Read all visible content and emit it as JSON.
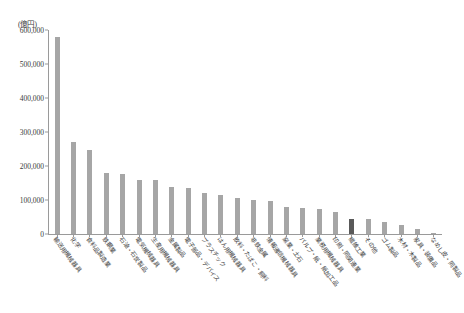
{
  "chart_data": {
    "type": "bar",
    "title": "",
    "subtitle": "",
    "xlabel": "",
    "ylabel": "",
    "unit_label": "(億円)",
    "ylim": [
      0,
      600000
    ],
    "ytick_labels": [
      "600,000",
      "500,000",
      "400,000",
      "300,000",
      "200,000",
      "100,000",
      "0"
    ],
    "ytick_values": [
      600000,
      500000,
      400000,
      300000,
      200000,
      100000,
      0
    ],
    "grid": false,
    "legend": "none",
    "highlight_index": 18,
    "colors": {
      "bar": "#a6a6a6",
      "bar_highlight": "#595959",
      "axis": "#9a9a9a",
      "text": "#3a3a3a"
    },
    "categories": [
      "輸送用機械器具",
      "化学",
      "食料品製造業",
      "鉄鋼業",
      "石油・石炭製品",
      "電気機械器具",
      "生産用機械器具",
      "金属製品",
      "電子部品・デバイス",
      "プラスチック",
      "はん用機械器具",
      "飲料・たばこ・飼料",
      "非鉄金属",
      "情報通信機械器具",
      "窯業・土石",
      "パルプ・紙・紙加工品",
      "業務用機械器具",
      "印刷・同関連業",
      "繊維工業",
      "その他",
      "ゴム製品",
      "木材・木製品",
      "家具・装備品",
      "なめし皮・同製品"
    ],
    "values": [
      580000,
      270000,
      248000,
      178000,
      176000,
      160000,
      158000,
      138000,
      136000,
      120000,
      114000,
      107000,
      100000,
      98000,
      78000,
      76000,
      74000,
      64000,
      45000,
      43000,
      34000,
      27000,
      14000,
      3000
    ]
  }
}
